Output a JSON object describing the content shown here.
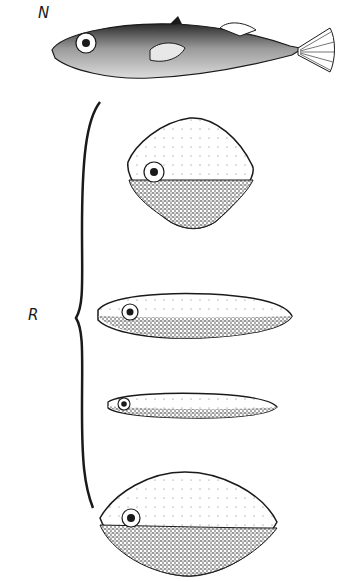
{
  "figure": {
    "labels": {
      "natural": "N",
      "realistic_models": "R"
    },
    "models": [
      {
        "id": "N",
        "description": "realistic stickleback fish drawing"
      },
      {
        "id": "R1",
        "description": "rhomboid model with dark underside"
      },
      {
        "id": "R2",
        "description": "elongated oval model with dark underside"
      },
      {
        "id": "R3",
        "description": "thin elongated model with dark underside"
      },
      {
        "id": "R4",
        "description": "lens-shaped model with dark underside"
      }
    ],
    "colors": {
      "ink": "#1a1a1a",
      "background": "#ffffff"
    }
  }
}
